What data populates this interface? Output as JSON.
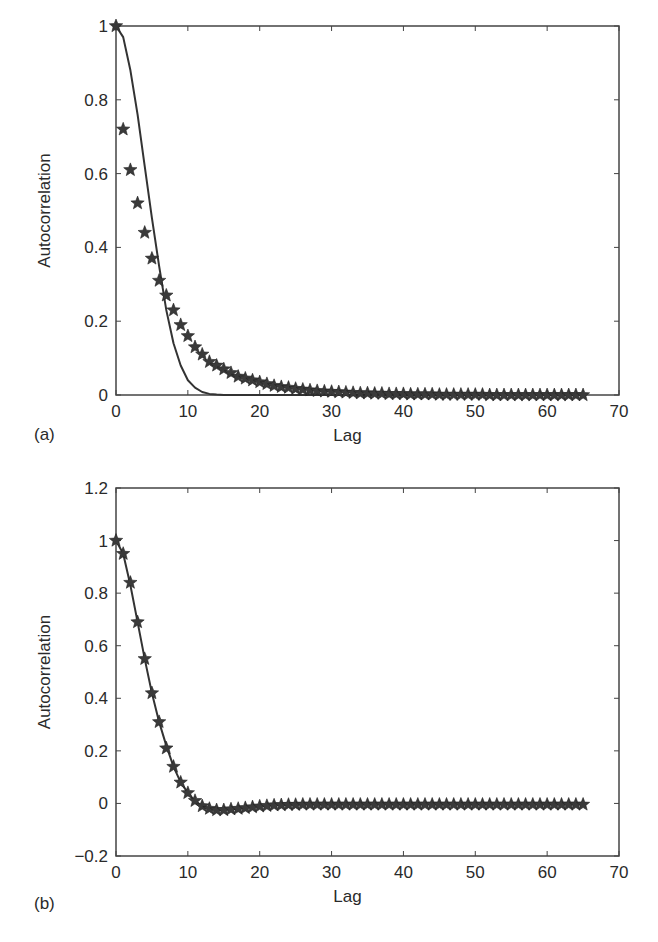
{
  "chart_data": [
    {
      "id": "a",
      "type": "line",
      "panel_label": "(a)",
      "title": "",
      "xlabel": "Lag",
      "ylabel": "Autocorrelation",
      "xlim": [
        0,
        70
      ],
      "ylim": [
        0,
        1
      ],
      "xticks": [
        0,
        10,
        20,
        30,
        40,
        50,
        60,
        70
      ],
      "yticks": [
        0,
        0.2,
        0.4,
        0.6,
        0.8,
        1
      ],
      "ytick_labels": [
        "0",
        "0.2",
        "0.4",
        "0.6",
        "0.8",
        "1"
      ],
      "grid": false,
      "series": [
        {
          "name": "theoretical",
          "style": "line",
          "x": [
            0,
            1,
            2,
            3,
            4,
            5,
            6,
            7,
            8,
            9,
            10,
            11,
            12,
            13,
            14,
            15,
            16,
            18,
            20,
            25,
            30,
            40,
            50,
            60,
            65
          ],
          "values": [
            1.0,
            0.97,
            0.88,
            0.76,
            0.62,
            0.48,
            0.35,
            0.23,
            0.14,
            0.08,
            0.04,
            0.02,
            0.008,
            0.003,
            0.001,
            0,
            0,
            0,
            0,
            0,
            0,
            0,
            0,
            0,
            0
          ]
        },
        {
          "name": "estimated",
          "style": "star-markers",
          "x": [
            0,
            1,
            2,
            3,
            4,
            5,
            6,
            7,
            8,
            9,
            10,
            11,
            12,
            13,
            14,
            15,
            16,
            17,
            18,
            19,
            20,
            21,
            22,
            23,
            24,
            25,
            26,
            27,
            28,
            29,
            30,
            31,
            32,
            33,
            34,
            35,
            36,
            37,
            38,
            39,
            40,
            41,
            42,
            43,
            44,
            45,
            46,
            47,
            48,
            49,
            50,
            51,
            52,
            53,
            54,
            55,
            56,
            57,
            58,
            59,
            60,
            61,
            62,
            63,
            64,
            65
          ],
          "values": [
            1.0,
            0.72,
            0.61,
            0.52,
            0.44,
            0.37,
            0.31,
            0.27,
            0.23,
            0.19,
            0.16,
            0.13,
            0.11,
            0.09,
            0.08,
            0.07,
            0.06,
            0.05,
            0.045,
            0.04,
            0.035,
            0.03,
            0.025,
            0.022,
            0.02,
            0.017,
            0.015,
            0.013,
            0.011,
            0.01,
            0.009,
            0.008,
            0.007,
            0.006,
            0.005,
            0.005,
            0.004,
            0.004,
            0.003,
            0.003,
            0.003,
            0.002,
            0.002,
            0.002,
            0.002,
            0.001,
            0.001,
            0.001,
            0.001,
            0.001,
            0.001,
            0.001,
            0,
            0,
            0,
            0,
            0,
            0,
            0,
            0,
            0,
            0,
            0,
            0,
            0,
            0
          ]
        }
      ]
    },
    {
      "id": "b",
      "type": "line",
      "panel_label": "(b)",
      "title": "",
      "xlabel": "Lag",
      "ylabel": "Autocorrelation",
      "xlim": [
        0,
        70
      ],
      "ylim": [
        -0.2,
        1.2
      ],
      "xticks": [
        0,
        10,
        20,
        30,
        40,
        50,
        60,
        70
      ],
      "yticks": [
        -0.2,
        0,
        0.2,
        0.4,
        0.6,
        0.8,
        1,
        1.2
      ],
      "ytick_labels": [
        "−0.2",
        "0",
        "0.2",
        "0.4",
        "0.6",
        "0.8",
        "1",
        "1.2"
      ],
      "grid": false,
      "series": [
        {
          "name": "theoretical",
          "style": "line",
          "x": [
            0,
            1,
            2,
            3,
            4,
            5,
            6,
            7,
            8,
            9,
            10,
            11,
            12,
            13,
            14,
            15,
            16,
            17,
            18,
            19,
            20,
            22,
            24,
            26,
            28,
            30,
            35,
            40,
            50,
            60,
            65
          ],
          "values": [
            1.0,
            0.95,
            0.83,
            0.69,
            0.55,
            0.42,
            0.31,
            0.22,
            0.14,
            0.08,
            0.04,
            0.01,
            -0.01,
            -0.02,
            -0.025,
            -0.025,
            -0.022,
            -0.02,
            -0.017,
            -0.014,
            -0.011,
            -0.007,
            -0.005,
            -0.004,
            -0.004,
            -0.004,
            -0.004,
            -0.004,
            -0.004,
            -0.004,
            -0.004
          ]
        },
        {
          "name": "estimated",
          "style": "star-markers",
          "x": [
            0,
            1,
            2,
            3,
            4,
            5,
            6,
            7,
            8,
            9,
            10,
            11,
            12,
            13,
            14,
            15,
            16,
            17,
            18,
            19,
            20,
            21,
            22,
            23,
            24,
            25,
            26,
            27,
            28,
            29,
            30,
            31,
            32,
            33,
            34,
            35,
            36,
            37,
            38,
            39,
            40,
            41,
            42,
            43,
            44,
            45,
            46,
            47,
            48,
            49,
            50,
            51,
            52,
            53,
            54,
            55,
            56,
            57,
            58,
            59,
            60,
            61,
            62,
            63,
            64,
            65
          ],
          "values": [
            1.0,
            0.95,
            0.84,
            0.69,
            0.55,
            0.42,
            0.31,
            0.21,
            0.14,
            0.08,
            0.04,
            0.01,
            -0.01,
            -0.02,
            -0.025,
            -0.025,
            -0.022,
            -0.02,
            -0.017,
            -0.014,
            -0.011,
            -0.009,
            -0.007,
            -0.006,
            -0.005,
            -0.005,
            -0.004,
            -0.004,
            -0.004,
            -0.004,
            -0.004,
            -0.004,
            -0.004,
            -0.004,
            -0.004,
            -0.004,
            -0.004,
            -0.004,
            -0.004,
            -0.004,
            -0.004,
            -0.004,
            -0.004,
            -0.004,
            -0.004,
            -0.004,
            -0.004,
            -0.004,
            -0.004,
            -0.004,
            -0.004,
            -0.004,
            -0.004,
            -0.004,
            -0.004,
            -0.004,
            -0.004,
            -0.004,
            -0.004,
            -0.004,
            -0.004,
            -0.004,
            -0.004,
            -0.004,
            -0.004,
            -0.004
          ]
        }
      ]
    }
  ],
  "layout": {
    "ink_color": "#333333",
    "axes_color": "#444444",
    "panels": [
      {
        "left": 116,
        "right": 619,
        "top": 26,
        "bottom": 395,
        "panel_label_x": 34,
        "panel_label_y": 440,
        "ylabel_x": 50
      },
      {
        "left": 116,
        "right": 619,
        "top": 23,
        "bottom": 391,
        "panel_label_x": 34,
        "panel_label_y": 444,
        "ylabel_x": 50
      }
    ]
  }
}
